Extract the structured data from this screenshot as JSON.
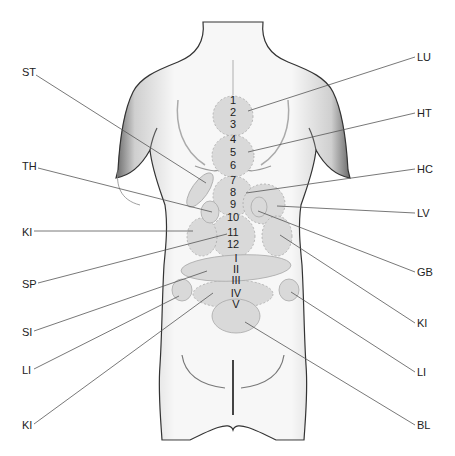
{
  "diagram": {
    "colors": {
      "background": "#ffffff",
      "zone_fill": "#d9d9d9",
      "zone_stroke": "#a8a8a8",
      "leader_line": "#555555",
      "text": "#222222"
    },
    "left_labels": [
      {
        "text": "ST",
        "x": 22,
        "y": 72,
        "tx": 206,
        "ty": 183
      },
      {
        "text": "TH",
        "x": 22,
        "y": 166,
        "tx": 212,
        "ty": 212
      },
      {
        "text": "KI",
        "x": 22,
        "y": 232,
        "tx": 193,
        "ty": 231
      },
      {
        "text": "SP",
        "x": 22,
        "y": 284,
        "tx": 227,
        "ty": 234
      },
      {
        "text": "SI",
        "x": 22,
        "y": 332,
        "tx": 207,
        "ty": 271
      },
      {
        "text": "LI",
        "x": 22,
        "y": 370,
        "tx": 179,
        "ty": 296
      },
      {
        "text": "KI",
        "x": 22,
        "y": 425,
        "tx": 213,
        "ty": 293
      }
    ],
    "right_labels": [
      {
        "text": "LU",
        "x": 417,
        "y": 57,
        "tx": 248,
        "ty": 111
      },
      {
        "text": "HT",
        "x": 417,
        "y": 113,
        "tx": 248,
        "ty": 152
      },
      {
        "text": "HC",
        "x": 417,
        "y": 169,
        "tx": 246,
        "ty": 193
      },
      {
        "text": "LV",
        "x": 417,
        "y": 213,
        "tx": 277,
        "ty": 206
      },
      {
        "text": "GB",
        "x": 417,
        "y": 272,
        "tx": 258,
        "ty": 211
      },
      {
        "text": "KI",
        "x": 417,
        "y": 323,
        "tx": 280,
        "ty": 235
      },
      {
        "text": "LI",
        "x": 417,
        "y": 372,
        "tx": 291,
        "ty": 292
      },
      {
        "text": "BL",
        "x": 417,
        "y": 425,
        "tx": 245,
        "ty": 322
      }
    ],
    "spine_labels": [
      {
        "text": "1",
        "x": 233,
        "y": 104
      },
      {
        "text": "2",
        "x": 233,
        "y": 116
      },
      {
        "text": "3",
        "x": 233,
        "y": 128
      },
      {
        "text": "4",
        "x": 233,
        "y": 143
      },
      {
        "text": "5",
        "x": 233,
        "y": 156
      },
      {
        "text": "6",
        "x": 233,
        "y": 169
      },
      {
        "text": "7",
        "x": 233,
        "y": 184
      },
      {
        "text": "8",
        "x": 233,
        "y": 196
      },
      {
        "text": "9",
        "x": 233,
        "y": 208
      },
      {
        "text": "10",
        "x": 233,
        "y": 221
      },
      {
        "text": "11",
        "x": 233,
        "y": 236
      },
      {
        "text": "12",
        "x": 233,
        "y": 248
      },
      {
        "text": "I",
        "x": 236,
        "y": 262
      },
      {
        "text": "II",
        "x": 236,
        "y": 272
      },
      {
        "text": "III",
        "x": 236,
        "y": 283
      },
      {
        "text": "IV",
        "x": 236,
        "y": 297
      },
      {
        "text": "V",
        "x": 236,
        "y": 307
      }
    ]
  }
}
